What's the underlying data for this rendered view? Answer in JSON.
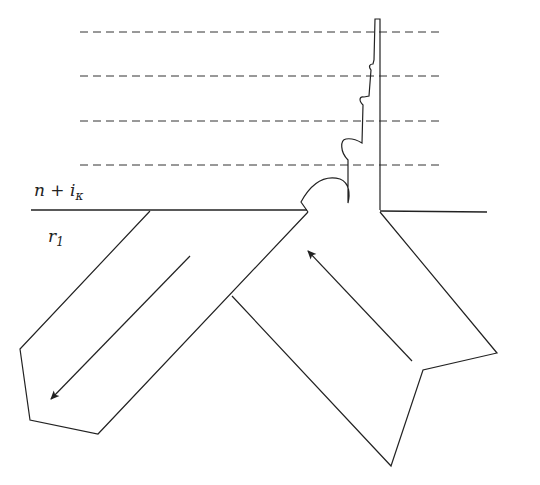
{
  "diagram": {
    "type": "refraction-reflection-schematic",
    "labels": {
      "upper_medium": {
        "main": "n + i",
        "subscript": "κ"
      },
      "lower_medium": {
        "main": "r",
        "subscript": "1"
      }
    },
    "dashed_levels": 4,
    "arrows": [
      {
        "name": "incident-arrow",
        "direction": "up-left"
      },
      {
        "name": "reflected-arrow",
        "direction": "down-left"
      }
    ],
    "colors": {
      "line": "#222222",
      "background": "#ffffff"
    }
  }
}
